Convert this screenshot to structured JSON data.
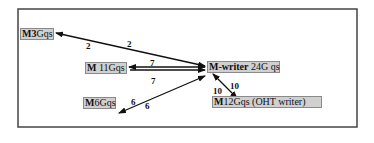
{
  "diagram": {
    "frame": {
      "x": 18,
      "y": 9,
      "width": 339,
      "height": 118,
      "stroke": "#444444"
    },
    "nodes": [
      {
        "id": "m3",
        "prefix": "M3",
        "rest": "Gqs",
        "label": "M3Gqs",
        "x": 20,
        "y": 28,
        "w": 34
      },
      {
        "id": "m11",
        "prefix": "M",
        "rest": " 11Gqs",
        "label": "M 11Gqs",
        "x": 85,
        "y": 62,
        "w": 42
      },
      {
        "id": "mwriter",
        "prefix": "M-writer",
        "rest": " 24G qs",
        "label": "M-writer 24G qs",
        "x": 207,
        "y": 61,
        "w": 73
      },
      {
        "id": "m6",
        "prefix": "M",
        "rest": "6Gqs",
        "label": "M6Gqs",
        "x": 83,
        "y": 97,
        "w": 33
      },
      {
        "id": "m12",
        "prefix": "M",
        "rest": "12Gqs (OHT writer)",
        "label": "M12Gqs (OHT writer)",
        "x": 212,
        "y": 96,
        "w": 110
      }
    ],
    "edges": [
      {
        "from": "mwriter",
        "to": "m3",
        "x1": 205,
        "y1": 66,
        "x2": 56,
        "y2": 33,
        "arrow_start": true,
        "arrow_end": true,
        "labels": [
          {
            "text": "2",
            "x": 86,
            "y": 42
          },
          {
            "text": "2",
            "x": 127,
            "y": 40
          }
        ]
      },
      {
        "from": "mwriter",
        "to": "m11",
        "x1": 205,
        "y1": 67,
        "x2": 129,
        "y2": 67,
        "arrow_start": true,
        "arrow_end": true,
        "labels": [
          {
            "text": "7",
            "x": 150,
            "y": 59
          }
        ]
      },
      {
        "from": "m11",
        "to": "mwriter",
        "x1": 130,
        "y1": 70,
        "x2": 205,
        "y2": 70,
        "arrow_start": false,
        "arrow_end": true,
        "labels": [
          {
            "text": "7",
            "x": 151,
            "y": 77
          }
        ]
      },
      {
        "from": "mwriter",
        "to": "m6",
        "x1": 205,
        "y1": 76,
        "x2": 119,
        "y2": 113,
        "arrow_start": true,
        "arrow_end": true,
        "labels": [
          {
            "text": "6",
            "x": 131,
            "y": 98
          },
          {
            "text": "6",
            "x": 145,
            "y": 102
          }
        ]
      },
      {
        "from": "mwriter",
        "to": "m12",
        "x1": 213,
        "y1": 74,
        "x2": 237,
        "y2": 98,
        "arrow_start": true,
        "arrow_end": true,
        "labels": [
          {
            "text": "10",
            "x": 213,
            "y": 87
          },
          {
            "text": "10",
            "x": 230,
            "y": 82
          }
        ]
      }
    ]
  }
}
